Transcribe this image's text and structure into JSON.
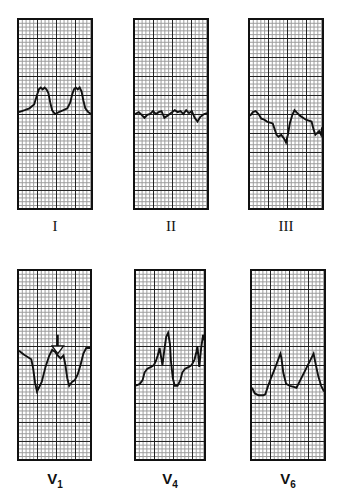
{
  "figure": {
    "panels": [
      {
        "id": "I",
        "label": "I",
        "sub": "",
        "row": 0,
        "col": 0
      },
      {
        "id": "II",
        "label": "II",
        "sub": "",
        "row": 0,
        "col": 1
      },
      {
        "id": "III",
        "label": "III",
        "sub": "",
        "row": 0,
        "col": 2
      },
      {
        "id": "V1",
        "label": "V",
        "sub": "1",
        "row": 1,
        "col": 0,
        "annotation": "arrow"
      },
      {
        "id": "V4",
        "label": "V",
        "sub": "4",
        "row": 1,
        "col": 1
      },
      {
        "id": "V6",
        "label": "V",
        "sub": "6",
        "row": 1,
        "col": 2
      }
    ]
  }
}
